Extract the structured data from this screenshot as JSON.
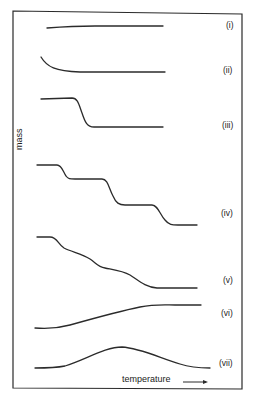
{
  "diagram": {
    "type": "thermogravimetric-curves",
    "axes": {
      "y_label": "mass",
      "x_label": "temperature",
      "x_arrow": "→"
    },
    "curves": [
      {
        "id": "i",
        "label": "(i)",
        "shape": "flat, essentially constant mass"
      },
      {
        "id": "ii",
        "label": "(ii)",
        "shape": "initial gradual loss then plateau"
      },
      {
        "id": "iii",
        "label": "(iii)",
        "shape": "single-step mass loss"
      },
      {
        "id": "iv",
        "label": "(iv)",
        "shape": "three-step mass loss with plateaus"
      },
      {
        "id": "v",
        "label": "(v)",
        "shape": "multi-step overlapping mass loss"
      },
      {
        "id": "vi",
        "label": "(vi)",
        "shape": "mass gain then plateau"
      },
      {
        "id": "vii",
        "label": "(vii)",
        "shape": "mass gain then mass loss"
      }
    ],
    "colors": {
      "line": "#2b2b2b",
      "background": "#ffffff"
    }
  }
}
